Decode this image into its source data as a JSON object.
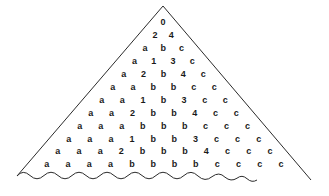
{
  "figure": {
    "shape": "triangle",
    "stroke_color": "#2b2b2b",
    "text_color": "#1a1a1a",
    "background_color": "#ffffff",
    "apex": {
      "x": 163,
      "y": 6
    },
    "left_corner": {
      "x": 17,
      "y": 176
    },
    "right_corner": {
      "x": 311,
      "y": 180
    },
    "rows": [
      {
        "index": 1,
        "cells": [
          "0"
        ]
      },
      {
        "index": 2,
        "cells": [
          "2",
          "4"
        ]
      },
      {
        "index": 3,
        "cells": [
          "a",
          "b",
          "c"
        ]
      },
      {
        "index": 4,
        "cells": [
          "a",
          "1",
          "3",
          "c"
        ]
      },
      {
        "index": 5,
        "cells": [
          "a",
          "2",
          "b",
          "4",
          "c"
        ]
      },
      {
        "index": 6,
        "cells": [
          "a",
          "a",
          "b",
          "b",
          "c",
          "c"
        ]
      },
      {
        "index": 7,
        "cells": [
          "a",
          "a",
          "1",
          "b",
          "3",
          "c",
          "c"
        ]
      },
      {
        "index": 8,
        "cells": [
          "a",
          "a",
          "2",
          "b",
          "b",
          "4",
          "c",
          "c"
        ]
      },
      {
        "index": 9,
        "cells": [
          "a",
          "a",
          "a",
          "b",
          "b",
          "b",
          "c",
          "c",
          "c"
        ]
      },
      {
        "index": 10,
        "cells": [
          "a",
          "a",
          "a",
          "1",
          "b",
          "b",
          "3",
          "c",
          "c",
          "c"
        ]
      },
      {
        "index": 11,
        "cells": [
          "a",
          "a",
          "a",
          "2",
          "b",
          "b",
          "b",
          "4",
          "c",
          "c",
          "c"
        ]
      },
      {
        "index": 12,
        "cells": [
          "a",
          "a",
          "a",
          "a",
          "b",
          "b",
          "b",
          "b",
          "c",
          "c",
          "c",
          "c"
        ]
      }
    ]
  }
}
